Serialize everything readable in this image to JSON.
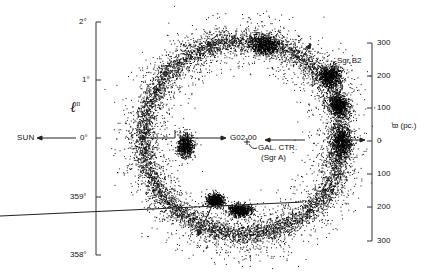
{
  "figure": {
    "left_axis": {
      "label": "ℓ",
      "label_superscript": "II",
      "ticks": [
        {
          "label": "2°",
          "y": 22
        },
        {
          "label": "1°",
          "y": 80
        },
        {
          "label": "0°",
          "y": 138
        },
        {
          "label": "359°",
          "y": 197
        },
        {
          "label": "358°",
          "y": 255
        }
      ]
    },
    "right_axis": {
      "label": "ϖ (pc.)",
      "ticks": [
        {
          "label": "300",
          "y": 43
        },
        {
          "label": "200",
          "y": 76
        },
        {
          "label": "100",
          "y": 108
        },
        {
          "label": "0",
          "y": 141
        },
        {
          "label": "100",
          "y": 174
        },
        {
          "label": "200",
          "y": 207
        },
        {
          "label": "300",
          "y": 241
        }
      ]
    },
    "annotations": {
      "sun": "SUN",
      "center_source": "G02-00",
      "gal_center_line1": "GAL. CTR.",
      "gal_center_line2": "(Sgr A)",
      "sgr_b2": "Sgr B2"
    },
    "ring": {
      "center_x": 240,
      "center_y": 143,
      "radius_x": 100,
      "radius_y": 100,
      "color": "#111111"
    }
  }
}
